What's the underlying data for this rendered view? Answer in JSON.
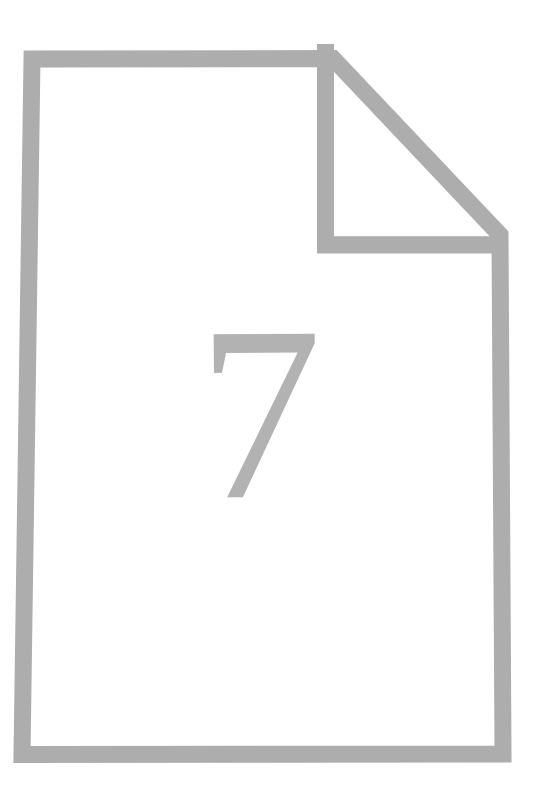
{
  "image": {
    "kind": "page-illustration",
    "width_px": 533,
    "height_px": 801,
    "background_color": "#ffffff",
    "alt_text": "Outline drawing of a sheet of paper with a folded top-right corner, containing the numeral 7"
  },
  "document_icon": {
    "icon_name": "page-with-folded-corner-icon",
    "stroke_color": "#adadad",
    "fill_color": "#ffffff",
    "stroke_width_px": 17,
    "outer_path_points": [
      {
        "x": 15,
        "y": 42
      },
      {
        "x": 333,
        "y": 42
      },
      {
        "x": 515,
        "y": 238
      },
      {
        "x": 512,
        "y": 763
      },
      {
        "x": 13,
        "y": 763
      }
    ],
    "fold": {
      "name": "folded-corner",
      "vertical_crease_x": 317,
      "horizontal_crease_y": 253,
      "diagonal_from": {
        "x": 333,
        "y": 42
      },
      "diagonal_to": {
        "x": 515,
        "y": 238
      }
    }
  },
  "page_number": {
    "label": "7",
    "color": "#b2b2b2",
    "font_style": "serif",
    "bounds": {
      "x": 200,
      "y": 333,
      "width": 118,
      "height": 175
    }
  },
  "caption": {
    "description": "Page 7 marker sheet"
  }
}
